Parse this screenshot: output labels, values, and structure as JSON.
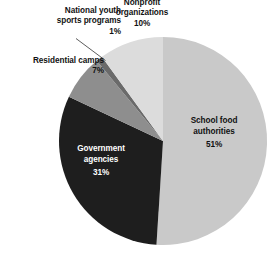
{
  "chart_data": {
    "type": "pie",
    "title": "",
    "subtitle": "",
    "xlabel": "",
    "ylabel": "",
    "legend_position": "none",
    "grid": false,
    "unit": "%",
    "total": 100,
    "categories": [
      "School food authorities",
      "Government agencies",
      "Residential camps",
      "National youth sports programs",
      "Nonprofit organizations"
    ],
    "values": [
      51,
      31,
      7,
      1,
      10
    ],
    "slices": [
      {
        "label": "School food authorities",
        "value": 51,
        "value_text": "51%",
        "color": "#c9c9c9",
        "label_placement": "inside",
        "text_color": "#111111"
      },
      {
        "label": "Government agencies",
        "value": 31,
        "value_text": "31%",
        "color": "#1e1e1e",
        "label_placement": "inside",
        "text_color": "#ffffff"
      },
      {
        "label": "Residential camps",
        "value": 7,
        "value_text": "7%",
        "color": "#8e8e8e",
        "label_placement": "outside",
        "text_color": "#121212"
      },
      {
        "label": "National youth sports programs",
        "value": 1,
        "value_text": "1%",
        "color": "#6a6a6a",
        "label_placement": "outside-leader",
        "text_color": "#121212"
      },
      {
        "label": "Nonprofit organizations",
        "value": 10,
        "value_text": "10%",
        "color": "#dcdcdc",
        "label_placement": "outside",
        "text_color": "#121212"
      }
    ]
  },
  "labels": {
    "national_youth": {
      "line1": "National youth",
      "line2": "sports programs",
      "pct": "1%"
    },
    "nonprofit": {
      "line1": "Nonprofit",
      "line2": "organizations",
      "pct": "10%"
    },
    "residential": {
      "line1": "Residential camps",
      "pct": "7%"
    },
    "school_food": {
      "line1": "School food",
      "line2": "authorities",
      "pct": "51%"
    },
    "government": {
      "line1": "Government",
      "line2": "agencies",
      "pct": "31%"
    }
  },
  "colors": {
    "background": "#ffffff",
    "school_food": "#c9c9c9",
    "government": "#1e1e1e",
    "residential": "#8e8e8e",
    "national_youth": "#6a6a6a",
    "nonprofit": "#dcdcdc",
    "leader_line": "#4a4a4a",
    "text_dark": "#121212",
    "text_light": "#ffffff"
  }
}
